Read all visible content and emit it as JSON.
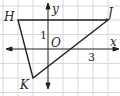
{
  "figure": {
    "type": "coordinate-grid-triangle",
    "axes": {
      "x_label": "x",
      "y_label": "y",
      "origin_label": "O"
    },
    "tick_labels": {
      "y_one": "1",
      "x_three": "3"
    },
    "vertices": [
      {
        "name": "H",
        "x": -2,
        "y": 2
      },
      {
        "name": "J",
        "x": 4,
        "y": 2
      },
      {
        "name": "K",
        "x": -1,
        "y": -2
      }
    ],
    "colors": {
      "grid": "#d9d9d9",
      "line": "#231f20",
      "background": "#ffffff"
    }
  }
}
